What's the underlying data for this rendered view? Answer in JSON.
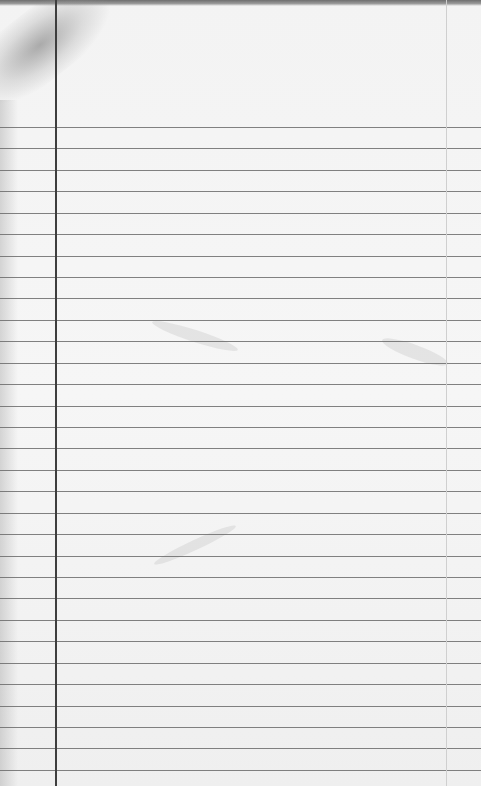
{
  "image": {
    "description": "Blank ruled notebook paper page",
    "paper_color": "#f4f4f4",
    "rule_color": "#6b6b6b",
    "margin_line_color": "#3e3e3e"
  },
  "layout": {
    "first_rule_y": 127,
    "rule_spacing": 21.43,
    "rule_count": 31,
    "left_margin_x": 55,
    "right_margin_x": 446
  }
}
